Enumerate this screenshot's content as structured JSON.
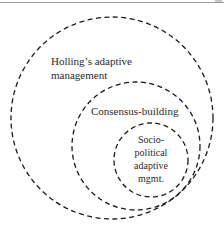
{
  "diagram": {
    "type": "nested-circles",
    "circles": [
      {
        "id": "outer",
        "label_lines": [
          "Holling’s adaptive",
          "management"
        ],
        "style": "dashed"
      },
      {
        "id": "middle",
        "label_lines": [
          "Consensus-building"
        ],
        "style": "dashed"
      },
      {
        "id": "inner",
        "label_lines": [
          "Socio-",
          "political",
          "adaptive",
          "mgmt."
        ],
        "style": "dashed"
      }
    ],
    "colors": {
      "stroke": "#1a1a1a",
      "text": "#2a2a2a",
      "background": "#ffffff"
    }
  }
}
